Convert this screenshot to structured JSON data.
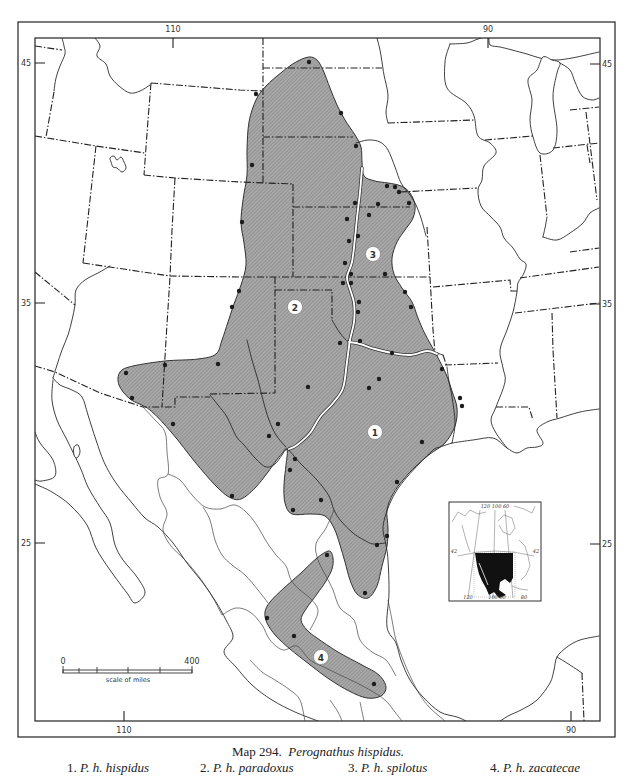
{
  "map": {
    "graticule": {
      "top_longitudes": [
        "110",
        "90"
      ],
      "bottom_longitudes": [
        "110",
        "90"
      ],
      "left_latitudes": [
        "45",
        "35",
        "25"
      ],
      "right_latitudes": [
        "45",
        "35",
        "25"
      ]
    },
    "range_labels": [
      "1",
      "2",
      "3",
      "4"
    ],
    "scale_bar": {
      "min": "0",
      "max": "400",
      "label": "scale of miles"
    },
    "inset": {
      "top_longitudes": "120 100 60",
      "left_latitude": "42",
      "right_latitude": "42",
      "bottom_left": "120",
      "bottom_middle": "100 90",
      "bottom_right": "80"
    },
    "colors": {
      "range_fill": "#a7a7a7",
      "hatch": "#838383",
      "locality_dot": "#1c1c1c",
      "subspecies_boundary": "#ffffff",
      "inset_range": "#111111"
    }
  },
  "caption": {
    "map_number": "Map 294.",
    "species": "Perognathus hispidus."
  },
  "legend": [
    {
      "number": "1.",
      "name": "P. h. hispidus"
    },
    {
      "number": "2.",
      "name": "P. h. paradoxus"
    },
    {
      "number": "3.",
      "name": "P. h. spilotus"
    },
    {
      "number": "4.",
      "name": "P. h. zacatecae"
    }
  ]
}
